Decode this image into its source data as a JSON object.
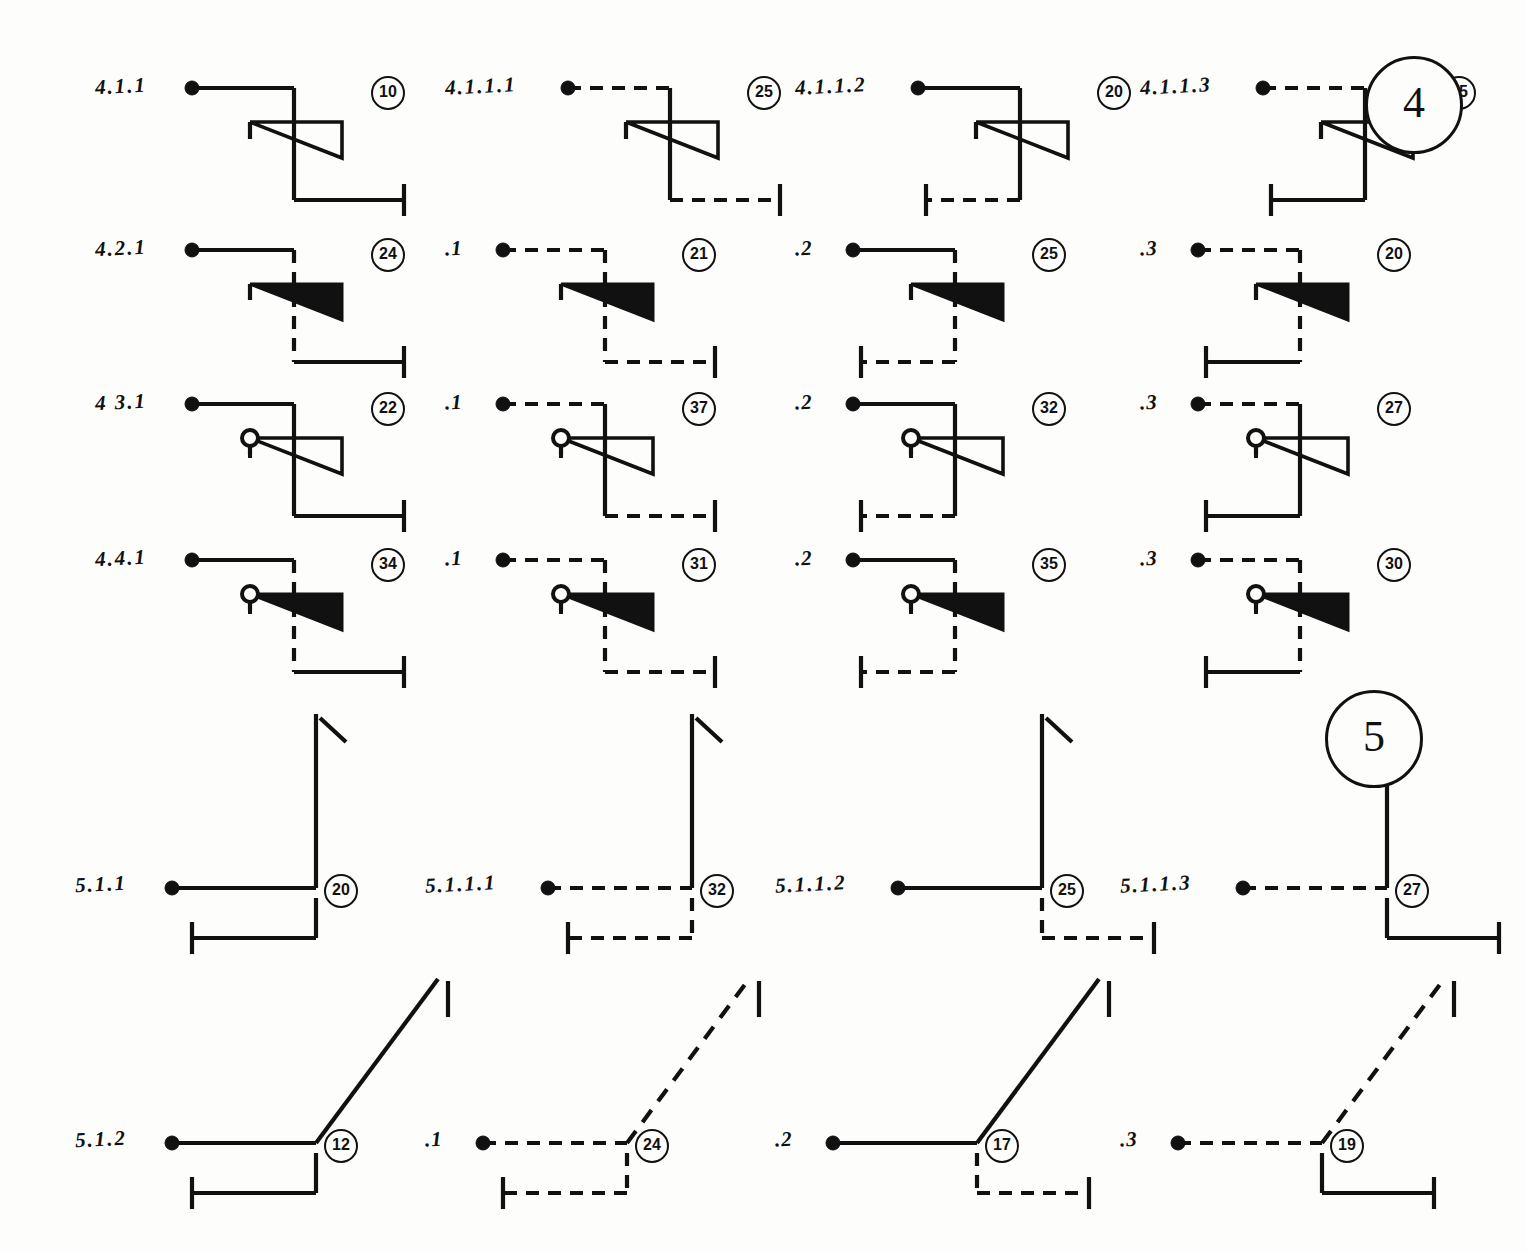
{
  "sheet": {
    "title": "Contact symbol schedule sheet",
    "background_color": "#fdfdfb",
    "ink_color": "#111111",
    "page_markers": [
      {
        "label": "4",
        "x": 1365,
        "y": 56
      },
      {
        "label": "5",
        "x": 1325,
        "y": 690
      }
    ]
  },
  "sections": [
    {
      "id": "section-4",
      "marker": "4",
      "rows": [
        {
          "id": "row-4-1",
          "symbol": "make-contact-open-arrow",
          "cells": [
            {
              "label": "4.1.1",
              "number": "10",
              "in_line": "solid",
              "stem": "solid",
              "out_line": "solid",
              "out_dir": "right",
              "arrow": "outline",
              "circle": false
            },
            {
              "label": "4.1.1.1",
              "number": "25",
              "in_line": "dashed",
              "stem": "solid",
              "out_line": "dashed",
              "out_dir": "right",
              "arrow": "outline",
              "circle": false
            },
            {
              "label": "4.1.1.2",
              "number": "20",
              "in_line": "solid",
              "stem": "solid",
              "out_line": "dashed",
              "out_dir": "left",
              "arrow": "outline",
              "circle": false
            },
            {
              "label": "4.1.1.3",
              "number": "15",
              "in_line": "dashed",
              "stem": "solid",
              "out_line": "solid",
              "out_dir": "left",
              "arrow": "outline",
              "circle": false
            }
          ]
        },
        {
          "id": "row-4-2",
          "symbol": "make-contact-filled-arrow",
          "cells": [
            {
              "label": "4.2.1",
              "number": "24",
              "in_line": "solid",
              "stem": "dashed",
              "out_line": "solid",
              "out_dir": "right",
              "arrow": "filled",
              "circle": false
            },
            {
              "label": ".1",
              "number": "21",
              "in_line": "dashed",
              "stem": "dashed",
              "out_line": "dashed",
              "out_dir": "right",
              "arrow": "filled",
              "circle": false
            },
            {
              "label": ".2",
              "number": "25",
              "in_line": "solid",
              "stem": "dashed",
              "out_line": "dashed",
              "out_dir": "left",
              "arrow": "filled",
              "circle": false
            },
            {
              "label": ".3",
              "number": "20",
              "in_line": "dashed",
              "stem": "dashed",
              "out_line": "solid",
              "out_dir": "left",
              "arrow": "filled",
              "circle": false
            }
          ]
        },
        {
          "id": "row-4-3",
          "symbol": "break-contact-open-arrow-with-circle",
          "cells": [
            {
              "label": "4 3.1",
              "number": "22",
              "in_line": "solid",
              "stem": "solid",
              "out_line": "solid",
              "out_dir": "right",
              "arrow": "outline",
              "circle": true
            },
            {
              "label": ".1",
              "number": "37",
              "in_line": "dashed",
              "stem": "solid",
              "out_line": "dashed",
              "out_dir": "right",
              "arrow": "outline",
              "circle": true
            },
            {
              "label": ".2",
              "number": "32",
              "in_line": "solid",
              "stem": "solid",
              "out_line": "dashed",
              "out_dir": "left",
              "arrow": "outline",
              "circle": true
            },
            {
              "label": ".3",
              "number": "27",
              "in_line": "dashed",
              "stem": "solid",
              "out_line": "solid",
              "out_dir": "left",
              "arrow": "outline",
              "circle": true
            }
          ]
        },
        {
          "id": "row-4-4",
          "symbol": "break-contact-filled-arrow-with-circle",
          "cells": [
            {
              "label": "4.4.1",
              "number": "34",
              "in_line": "solid",
              "stem": "dashed",
              "out_line": "solid",
              "out_dir": "right",
              "arrow": "filled",
              "circle": true
            },
            {
              "label": ".1",
              "number": "31",
              "in_line": "dashed",
              "stem": "dashed",
              "out_line": "dashed",
              "out_dir": "right",
              "arrow": "filled",
              "circle": true
            },
            {
              "label": ".2",
              "number": "35",
              "in_line": "solid",
              "stem": "dashed",
              "out_line": "dashed",
              "out_dir": "left",
              "arrow": "filled",
              "circle": true
            },
            {
              "label": ".3",
              "number": "30",
              "in_line": "dashed",
              "stem": "dashed",
              "out_line": "solid",
              "out_dir": "left",
              "arrow": "filled",
              "circle": true
            }
          ]
        }
      ]
    },
    {
      "id": "section-5",
      "marker": "5",
      "rows": [
        {
          "id": "row-5-1",
          "symbol": "vertical-riser-with-tick",
          "cells": [
            {
              "label": "5.1.1",
              "number": "20",
              "in_line": "solid",
              "riser": "solid",
              "out_line": "solid",
              "out_dir": "left",
              "diagonal": false
            },
            {
              "label": "5.1.1.1",
              "number": "32",
              "in_line": "dashed",
              "riser": "solid",
              "out_line": "dashed",
              "out_dir": "left",
              "diagonal": false
            },
            {
              "label": "5.1.1.2",
              "number": "25",
              "in_line": "solid",
              "riser": "solid",
              "out_line": "dashed",
              "out_dir": "right",
              "diagonal": false
            },
            {
              "label": "5.1.1.3",
              "number": "27",
              "in_line": "dashed",
              "riser": "solid",
              "out_line": "solid",
              "out_dir": "right",
              "diagonal": false
            }
          ]
        },
        {
          "id": "row-5-2",
          "symbol": "diagonal-riser-with-tick",
          "cells": [
            {
              "label": "5.1.2",
              "number": "12",
              "in_line": "solid",
              "diagonal_line": "solid",
              "out_line": "solid",
              "out_dir": "left",
              "diagonal": true
            },
            {
              "label": ".1",
              "number": "24",
              "in_line": "dashed",
              "diagonal_line": "dashed",
              "out_line": "dashed",
              "out_dir": "left",
              "diagonal": true
            },
            {
              "label": ".2",
              "number": "17",
              "in_line": "solid",
              "diagonal_line": "solid",
              "out_line": "dashed",
              "out_dir": "right",
              "diagonal": true
            },
            {
              "label": ".3",
              "number": "19",
              "in_line": "dashed",
              "diagonal_line": "dashed",
              "out_line": "solid",
              "out_dir": "right",
              "diagonal": true
            }
          ]
        }
      ]
    }
  ]
}
